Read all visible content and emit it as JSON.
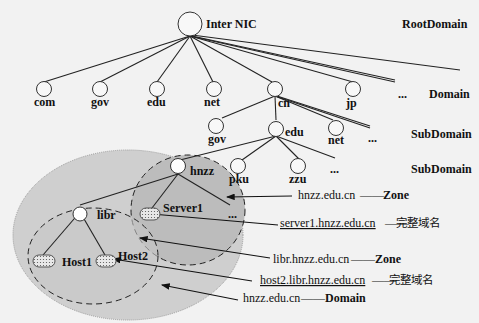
{
  "diagram": {
    "root": {
      "node": "",
      "label": "Inter NIC"
    },
    "levels": {
      "root": "RootDomain",
      "domain": "Domain",
      "subdomain1": "SubDomain",
      "subdomain2": "SubDomain"
    },
    "top_level_domains": [
      "com",
      "gov",
      "edu",
      "net",
      "cn",
      "jp",
      "..."
    ],
    "cn_children": [
      "gov",
      "edu",
      "net",
      "..."
    ],
    "edu_children": [
      "hnzz",
      "pku",
      "zzu",
      "..."
    ],
    "hnzz_children": [
      "libr",
      "Server1",
      "..."
    ],
    "libr_children": [
      "Host1",
      "Host2"
    ],
    "annotations": [
      {
        "name": "hnzz.edu.cn",
        "dash": "——",
        "type": "Zone",
        "underline": false
      },
      {
        "name": "server1.hnzz.edu.cn",
        "dash": "——",
        "type": "完整域名",
        "underline": true
      },
      {
        "name": "libr.hnzz.edu.cn",
        "dash": "——",
        "type": "Zone",
        "underline": false
      },
      {
        "name": "host2.libr.hnzz.edu.cn",
        "dash": "——",
        "type": "完整域名",
        "underline": true
      },
      {
        "name": "hnzz.edu.cn",
        "dash": "——",
        "type": "Domain",
        "underline": false
      }
    ],
    "colors": {
      "background": "#f2f2f2",
      "outer_ellipse_fill": "#cfcfcf",
      "zone_fill": "#bdbdbd",
      "line": "#222222",
      "node_fill": "#f8f8f8"
    }
  }
}
